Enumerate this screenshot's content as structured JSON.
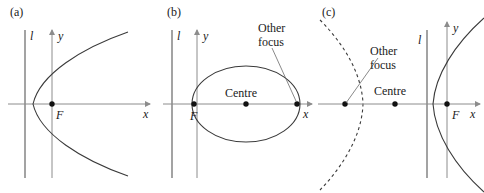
{
  "figure": {
    "type": "conic-sections-diagram",
    "background": "#ffffff",
    "curve_color": "#3a3a3a",
    "axis_color": "#8c8c8c",
    "text_color": "#1a1a1a",
    "panels": [
      {
        "id": "a",
        "label": "(a)",
        "conic": "parabola",
        "opens": "right",
        "directrix_label": "l",
        "axis_labels": {
          "x": "x",
          "y": "y"
        },
        "points": [
          {
            "name": "focus",
            "label": "F"
          }
        ],
        "annotations": []
      },
      {
        "id": "b",
        "label": "(b)",
        "conic": "ellipse",
        "directrix_label": "l",
        "axis_labels": {
          "x": "x",
          "y": "y"
        },
        "points": [
          {
            "name": "focus",
            "label": "F"
          },
          {
            "name": "centre",
            "label": "Centre"
          },
          {
            "name": "other-focus",
            "label": ""
          }
        ],
        "annotations": [
          {
            "name": "other-focus",
            "line1": "Other",
            "line2": "focus"
          }
        ]
      },
      {
        "id": "c",
        "label": "(c)",
        "conic": "hyperbola",
        "directrix_label": "l",
        "axis_labels": {
          "x": "x",
          "y": "y"
        },
        "points": [
          {
            "name": "focus",
            "label": "F"
          },
          {
            "name": "centre",
            "label": "Centre"
          },
          {
            "name": "other-focus",
            "label": ""
          }
        ],
        "annotations": [
          {
            "name": "other-focus",
            "line1": "Other",
            "line2": "focus"
          }
        ],
        "dashed_branch": true
      }
    ]
  }
}
